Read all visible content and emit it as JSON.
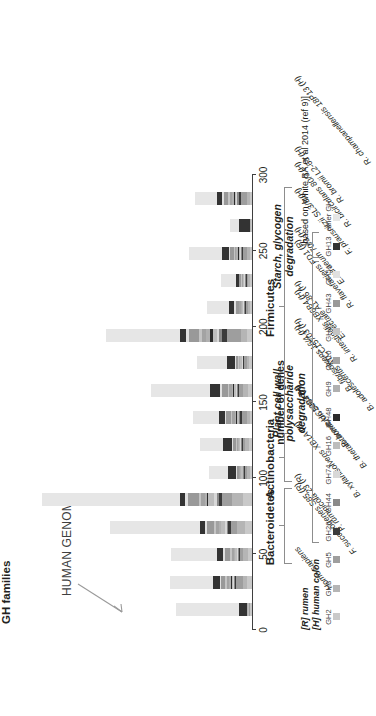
{
  "figure": {
    "gh_families_label": "GH families",
    "human_genome_label": "HUMAN GENOME",
    "source_note": "[based on White BA et al 2014 (ref 9)]",
    "key_note_line1": "[R] rumen",
    "key_note_line2": "[H] human colon"
  },
  "chart_data": {
    "type": "bar",
    "orientation": "vertical-stacked",
    "title": "GH families",
    "xlabel": "",
    "ylabel": "number of genes",
    "ylim": [
      0,
      300
    ],
    "yticks": [
      0,
      50,
      100,
      150,
      200,
      250,
      300
    ],
    "grid": false,
    "legend_position": "below",
    "categories": [
      "Homo sapiens",
      "F. succinogenes S85 (R)",
      "P. ruminicola 23 (R)",
      "B. xylanisolvens XB1A (H)",
      "B. thetaiotaomicron 5484 (H)",
      "B. breve UC2003 (H)",
      "B. adolescentis ATCC15703 (H)",
      "B. fibrisolvens 16/4 (H)",
      "R. intestinalis XB6B4 (H)",
      "E. rectale A1-86 (H)",
      "R. flavefaciens FD1 (R)",
      "E. siraeum 70/3 (H)",
      "F. prausnitzii SL3/3 (H)",
      "R. bicirculans 80/3 (H)",
      "R. bromii L2-63 (H)",
      "R. champanellensis 18P13 (H)"
    ],
    "series": [
      {
        "name": "GH2",
        "color": "#c9c9c9",
        "values": [
          2,
          6,
          5,
          9,
          12,
          3,
          4,
          3,
          5,
          4,
          6,
          2,
          2,
          3,
          1,
          3
        ]
      },
      {
        "name": "GH3",
        "color": "#b5b5b5",
        "values": [
          1,
          5,
          6,
          10,
          14,
          4,
          5,
          4,
          6,
          3,
          8,
          3,
          3,
          4,
          1,
          4
        ]
      },
      {
        "name": "GH5",
        "color": "#9e9e9e",
        "values": [
          1,
          9,
          4,
          8,
          12,
          2,
          3,
          6,
          5,
          3,
          18,
          3,
          2,
          4,
          0,
          7
        ]
      },
      {
        "name": "GH26",
        "color": "#3b3b3b",
        "values": [
          0,
          2,
          2,
          3,
          4,
          1,
          1,
          2,
          2,
          1,
          6,
          1,
          1,
          2,
          0,
          3
        ]
      },
      {
        "name": "GH44",
        "color": "#8a8a8a",
        "values": [
          0,
          1,
          1,
          2,
          3,
          1,
          1,
          1,
          1,
          1,
          4,
          1,
          1,
          1,
          0,
          2
        ]
      },
      {
        "name": "GH74",
        "color": "#d8d8d8",
        "values": [
          0,
          1,
          1,
          2,
          3,
          1,
          1,
          1,
          1,
          1,
          3,
          1,
          1,
          1,
          0,
          1
        ]
      },
      {
        "name": "GH16",
        "color": "#bdbdbd",
        "values": [
          1,
          2,
          3,
          5,
          8,
          2,
          2,
          2,
          3,
          2,
          5,
          2,
          1,
          2,
          1,
          2
        ]
      },
      {
        "name": "GH48",
        "color": "#2b2b2b",
        "values": [
          0,
          1,
          0,
          1,
          1,
          0,
          0,
          1,
          1,
          0,
          3,
          0,
          0,
          1,
          0,
          1
        ]
      },
      {
        "name": "GH9",
        "color": "#b0b0b0",
        "values": [
          1,
          2,
          1,
          2,
          3,
          1,
          1,
          2,
          2,
          1,
          5,
          1,
          1,
          2,
          0,
          2
        ]
      },
      {
        "name": "GH10",
        "color": "#a3a3a3",
        "values": [
          0,
          3,
          3,
          4,
          5,
          1,
          1,
          3,
          3,
          1,
          6,
          2,
          1,
          2,
          0,
          3
        ]
      },
      {
        "name": "GH11",
        "color": "#c4c4c4",
        "values": [
          0,
          2,
          2,
          2,
          3,
          1,
          1,
          2,
          2,
          1,
          4,
          1,
          1,
          1,
          0,
          2
        ]
      },
      {
        "name": "GH43",
        "color": "#999999",
        "values": [
          0,
          5,
          7,
          9,
          13,
          2,
          4,
          6,
          7,
          3,
          12,
          4,
          2,
          5,
          0,
          6
        ]
      },
      {
        "name": "GH51",
        "color": "#e0e0e0",
        "values": [
          0,
          2,
          2,
          3,
          4,
          1,
          2,
          2,
          3,
          1,
          4,
          2,
          1,
          2,
          0,
          2
        ]
      },
      {
        "name": "GH13",
        "color": "#333333",
        "values": [
          10,
          9,
          8,
          6,
          7,
          10,
          11,
          7,
          12,
          10,
          8,
          6,
          4,
          8,
          13,
          7
        ]
      },
      {
        "name": "other GH",
        "color": "#e6e6e6",
        "values": [
          81,
          55,
          58,
          115,
          175,
          25,
          29,
          33,
          75,
          38,
          94,
          28,
          18,
          42,
          12,
          28
        ]
      }
    ],
    "totals": [
      97,
      105,
      103,
      181,
      267,
      55,
      66,
      75,
      128,
      70,
      186,
      57,
      39,
      80,
      28,
      73
    ]
  },
  "legend_groups": [
    {
      "label": "Plant cell wall\npolysaccharide\ndegradation",
      "first": 3,
      "last": 12
    },
    {
      "label": "Starch, glycogen\ndegradation",
      "first": 13,
      "last": 13
    }
  ],
  "taxon_groups": [
    {
      "label": "Bacteroidetes",
      "first": 2,
      "last": 4
    },
    {
      "label": "Actinobacteria",
      "first": 5,
      "last": 6
    },
    {
      "label": "Firmicutes",
      "first": 7,
      "last": 15
    }
  ]
}
